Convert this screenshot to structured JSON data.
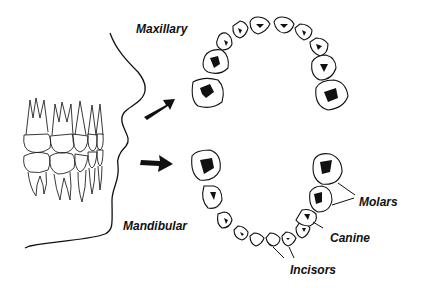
{
  "diagram": {
    "labels": {
      "maxillary": "Maxillary",
      "mandibular": "Mandibular",
      "molars": "Molars",
      "canine": "Canine",
      "incisors": "Incisors"
    },
    "colors": {
      "ink": "#111111",
      "background": "#ffffff"
    }
  }
}
